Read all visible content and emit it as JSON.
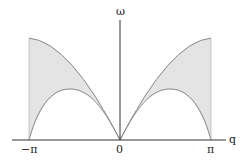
{
  "diagram": {
    "type": "dispersion-continuum",
    "axes": {
      "x_label": "q",
      "y_label": "ω",
      "x_ticks": [
        "−π",
        "0",
        "π"
      ]
    },
    "regions": [
      {
        "name": "left-continuum",
        "fill": "#e4e4e4",
        "range": [
          "−π",
          "0"
        ]
      },
      {
        "name": "right-continuum",
        "fill": "#e4e4e4",
        "range": [
          "0",
          "π"
        ]
      }
    ],
    "curves": {
      "upper": "ω ∝ |sin(q/2)|",
      "lower": "ω ∝ |sin q|"
    },
    "colors": {
      "axis": "#333333",
      "curve": "#888888",
      "fill": "#e4e4e4"
    }
  }
}
